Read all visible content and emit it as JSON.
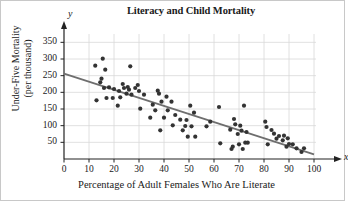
{
  "chart_data": {
    "type": "scatter",
    "title": "Literacy and Child Mortality",
    "xlabel": "Percentage of Adult Females Who Are Literate",
    "ylabel_line1": "Under-Five Mortality",
    "ylabel_line2": "(per thousand)",
    "x_axis_name": "x",
    "y_axis_name": "y",
    "xlim": [
      0,
      100
    ],
    "ylim": [
      0,
      375
    ],
    "xticks": [
      0,
      10,
      20,
      30,
      40,
      50,
      60,
      70,
      80,
      90,
      100
    ],
    "yticks": [
      50,
      100,
      150,
      200,
      250,
      300,
      350
    ],
    "grid": true,
    "legend": "none",
    "point_color": "#333333",
    "line_color": "#6e6e6e",
    "grid_color": "#d8d8d8",
    "axis_color": "#222222",
    "trend_line": {
      "label": "least-squares regression line",
      "x_start": 0,
      "y_start": 256,
      "x_end": 100,
      "y_end": 14
    },
    "points": [
      [
        12.5,
        280
      ],
      [
        13.0,
        176
      ],
      [
        14.5,
        230
      ],
      [
        15.5,
        301
      ],
      [
        15.0,
        241
      ],
      [
        16.0,
        213
      ],
      [
        16.5,
        268
      ],
      [
        17.0,
        183
      ],
      [
        18.0,
        215
      ],
      [
        19.5,
        183
      ],
      [
        20.0,
        210
      ],
      [
        21.5,
        160
      ],
      [
        22.0,
        204
      ],
      [
        22.5,
        185
      ],
      [
        23.5,
        225
      ],
      [
        24.0,
        213
      ],
      [
        25.0,
        196
      ],
      [
        25.5,
        216
      ],
      [
        26.0,
        208
      ],
      [
        26.5,
        278
      ],
      [
        27.0,
        193
      ],
      [
        28.5,
        213
      ],
      [
        29.5,
        222
      ],
      [
        30.0,
        204
      ],
      [
        30.5,
        151
      ],
      [
        32.0,
        193
      ],
      [
        34.5,
        124
      ],
      [
        35.5,
        163
      ],
      [
        36.5,
        146
      ],
      [
        37.5,
        205
      ],
      [
        38.0,
        196
      ],
      [
        38.5,
        86
      ],
      [
        39.0,
        172
      ],
      [
        40.0,
        124
      ],
      [
        41.0,
        187
      ],
      [
        41.5,
        146
      ],
      [
        43.0,
        172
      ],
      [
        43.5,
        101
      ],
      [
        44.5,
        132
      ],
      [
        46.5,
        118
      ],
      [
        47.5,
        86
      ],
      [
        48.5,
        99
      ],
      [
        49.0,
        117
      ],
      [
        49.5,
        67
      ],
      [
        50.5,
        160
      ],
      [
        51.0,
        98
      ],
      [
        52.0,
        139
      ],
      [
        52.5,
        67
      ],
      [
        57.0,
        98
      ],
      [
        58.5,
        112
      ],
      [
        62.0,
        156
      ],
      [
        62.5,
        47
      ],
      [
        66.5,
        88
      ],
      [
        67.0,
        30
      ],
      [
        67.5,
        37
      ],
      [
        68.0,
        120
      ],
      [
        68.5,
        104
      ],
      [
        69.5,
        75
      ],
      [
        70.0,
        44
      ],
      [
        70.5,
        100
      ],
      [
        71.0,
        85
      ],
      [
        71.5,
        30
      ],
      [
        72.0,
        160
      ],
      [
        72.5,
        49
      ],
      [
        73.0,
        81
      ],
      [
        73.5,
        49
      ],
      [
        80.5,
        112
      ],
      [
        81.0,
        96
      ],
      [
        81.5,
        44
      ],
      [
        83.0,
        87
      ],
      [
        84.0,
        76
      ],
      [
        85.0,
        61
      ],
      [
        86.0,
        69
      ],
      [
        87.5,
        56
      ],
      [
        88.0,
        70
      ],
      [
        89.0,
        37
      ],
      [
        89.5,
        62
      ],
      [
        90.0,
        45
      ],
      [
        91.5,
        44
      ],
      [
        93.0,
        32
      ],
      [
        95.0,
        21
      ],
      [
        96.0,
        32
      ]
    ]
  }
}
